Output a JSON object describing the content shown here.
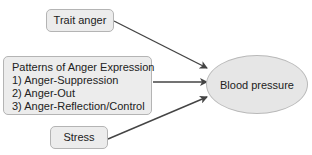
{
  "diagram": {
    "nodes": {
      "trait_anger": {
        "label": "Trait anger"
      },
      "patterns": {
        "title": "Patterns of Anger Expression",
        "items": [
          "1) Anger-Suppression",
          "2) Anger-Out",
          "3) Anger-Reflection/Control"
        ]
      },
      "stress": {
        "label": "Stress"
      },
      "blood_pressure": {
        "label": "Blood pressure"
      }
    },
    "edges": [
      {
        "from": "Trait anger",
        "to": "Blood pressure"
      },
      {
        "from": "Patterns of Anger Expression",
        "to": "Blood pressure"
      },
      {
        "from": "Stress",
        "to": "Blood pressure"
      }
    ],
    "colors": {
      "box_fill": "#ececec",
      "box_border": "#b4b4b4",
      "arrow": "#444444",
      "ellipse_fill": "#e6e6e6"
    }
  }
}
